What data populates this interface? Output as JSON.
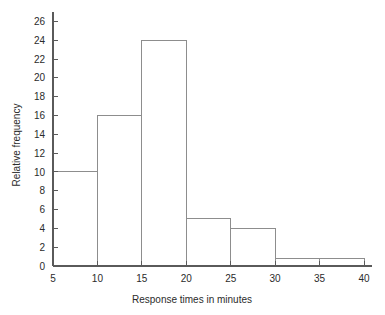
{
  "chart_data": {
    "type": "bar",
    "title": "",
    "subtitle": "",
    "xlabel": "Response times in minutes",
    "ylabel": "Relative frequency",
    "bin_edges": [
      5,
      10,
      15,
      20,
      25,
      30,
      35,
      40
    ],
    "categories": [
      "5-10",
      "10-15",
      "15-20",
      "20-25",
      "25-30",
      "30-35",
      "35-40"
    ],
    "values": [
      10,
      16,
      24,
      5,
      4,
      0.8,
      0.8
    ],
    "xlim": [
      5,
      40
    ],
    "ylim": [
      0,
      27
    ],
    "xticks": [
      5,
      10,
      15,
      20,
      25,
      30,
      35,
      40
    ],
    "xtick_labels": [
      "5",
      "10",
      "15",
      "20",
      "25",
      "30",
      "35",
      "40"
    ],
    "yticks": [
      0,
      2,
      4,
      6,
      8,
      10,
      12,
      14,
      16,
      18,
      20,
      22,
      24,
      26
    ],
    "ytick_labels": [
      "0",
      "2",
      "4",
      "6",
      "8",
      "10",
      "12",
      "14",
      "16",
      "18",
      "20",
      "22",
      "24",
      "26"
    ],
    "grid": false,
    "legend": false,
    "legend_position": "none",
    "bar_fill": "#ffffff",
    "bar_stroke": "#8d8d8d",
    "axis_color": "#5a5a5a",
    "text_color": "#2b2b2b",
    "background": "#ffffff"
  }
}
